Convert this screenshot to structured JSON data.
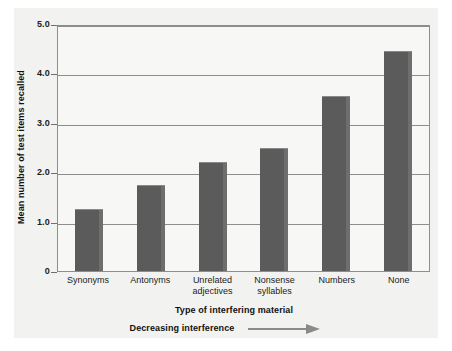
{
  "chart_data": {
    "type": "bar",
    "title": "",
    "categories": [
      "Synonyms",
      "Antonyms",
      "Unrelated adjectives",
      "Nonsense syllables",
      "Numbers",
      "None"
    ],
    "category_lines": [
      [
        "Synonyms"
      ],
      [
        "Antonyms"
      ],
      [
        "Unrelated",
        "adjectives"
      ],
      [
        "Nonsense",
        "syllables"
      ],
      [
        "Numbers"
      ],
      [
        "None"
      ]
    ],
    "values": [
      1.25,
      1.75,
      2.2,
      2.5,
      3.55,
      4.45
    ],
    "xlabel": "Type of interfering material",
    "ylabel": "Mean number of test items recalled",
    "ylim": [
      0,
      5.0
    ],
    "ytick_values": [
      0,
      1.0,
      2.0,
      3.0,
      4.0,
      5.0
    ],
    "ytick_labels": [
      "0",
      "1.0",
      "2.0",
      "3.0",
      "4.0",
      "5.0"
    ],
    "grid": true,
    "legend": "none",
    "annotation": "Decreasing interference",
    "annotation_icon": "right-arrow-icon",
    "colors": {
      "bar": "#5b5b5b",
      "bar_highlight": "#6e6e6e",
      "plot_background": "#f7f7f5",
      "panel_background": "#f2f2f0",
      "axis": "#8d8d8d",
      "text": "#1c1c1c",
      "arrow": "#8a8a8a"
    }
  }
}
